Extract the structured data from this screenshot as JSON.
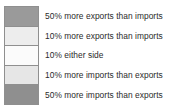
{
  "legend": {
    "title": "",
    "orientation": "vertical",
    "background_color": "#ffffff",
    "border_color": "#8f8f8f",
    "text_color": "#2b2b2b",
    "entries": [
      {
        "label": "50% more exports than imports",
        "swatch_color": "#9a9a9a",
        "swatch_name": "swatch-exports-50"
      },
      {
        "label": "10% more exports than imports",
        "swatch_color": "#ededed",
        "swatch_name": "swatch-exports-10"
      },
      {
        "label": "10% either side",
        "swatch_color": "#fbfbfb",
        "swatch_name": "swatch-either-side-10"
      },
      {
        "label": "10% more imports than exports",
        "swatch_color": "#e6e6e6",
        "swatch_name": "swatch-imports-10"
      },
      {
        "label": "50% more imports than exports",
        "swatch_color": "#8f8f8f",
        "swatch_name": "swatch-imports-50"
      }
    ]
  }
}
